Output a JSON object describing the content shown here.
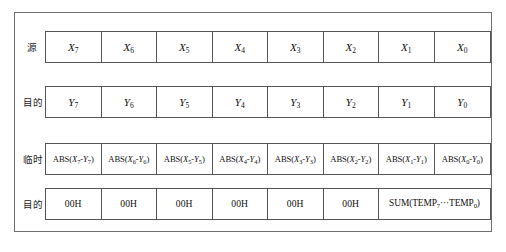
{
  "diagram": {
    "border_color": "#6e6e6e",
    "cell_border_color": "#555555",
    "background": "#ffffff",
    "rows": [
      {
        "id": "source-row",
        "label": "源",
        "label_meaning": "source",
        "cells": [
          {
            "kind": "var",
            "base": "X",
            "sub": "7",
            "text": "X7"
          },
          {
            "kind": "var",
            "base": "X",
            "sub": "6",
            "text": "X6"
          },
          {
            "kind": "var",
            "base": "X",
            "sub": "5",
            "text": "X5"
          },
          {
            "kind": "var",
            "base": "X",
            "sub": "4",
            "text": "X4"
          },
          {
            "kind": "var",
            "base": "X",
            "sub": "3",
            "text": "X3"
          },
          {
            "kind": "var",
            "base": "X",
            "sub": "2",
            "text": "X2"
          },
          {
            "kind": "var",
            "base": "X",
            "sub": "1",
            "text": "X1"
          },
          {
            "kind": "var",
            "base": "X",
            "sub": "0",
            "text": "X0"
          }
        ]
      },
      {
        "id": "destination-row-top",
        "label": "目的",
        "label_meaning": "destination",
        "cells": [
          {
            "kind": "var",
            "base": "Y",
            "sub": "7",
            "text": "Y7"
          },
          {
            "kind": "var",
            "base": "Y",
            "sub": "6",
            "text": "Y6"
          },
          {
            "kind": "var",
            "base": "Y",
            "sub": "5",
            "text": "Y5"
          },
          {
            "kind": "var",
            "base": "Y",
            "sub": "4",
            "text": "Y4"
          },
          {
            "kind": "var",
            "base": "Y",
            "sub": "3",
            "text": "Y3"
          },
          {
            "kind": "var",
            "base": "Y",
            "sub": "2",
            "text": "Y2"
          },
          {
            "kind": "var",
            "base": "Y",
            "sub": "1",
            "text": "Y1"
          },
          {
            "kind": "var",
            "base": "Y",
            "sub": "0",
            "text": "Y0"
          }
        ]
      },
      {
        "id": "temporary-row",
        "label": "临时",
        "label_meaning": "temporary",
        "cells": [
          {
            "kind": "expr",
            "sub": "7",
            "text": "ABS(X7-Y7)"
          },
          {
            "kind": "expr",
            "sub": "6",
            "text": "ABS(X6-Y6)"
          },
          {
            "kind": "expr",
            "sub": "5",
            "text": "ABS(X5-Y5)"
          },
          {
            "kind": "expr",
            "sub": "4",
            "text": "ABS(X4-Y4)"
          },
          {
            "kind": "expr",
            "sub": "3",
            "text": "ABS(X3-Y3)"
          },
          {
            "kind": "expr",
            "sub": "2",
            "text": "ABS(X2-Y2)"
          },
          {
            "kind": "expr",
            "sub": "1",
            "text": "ABS(X1-Y1)"
          },
          {
            "kind": "expr",
            "sub": "0",
            "text": "ABS(X0-Y0)"
          }
        ]
      },
      {
        "id": "destination-row-bottom",
        "label": "目的",
        "label_meaning": "destination",
        "cells": [
          {
            "kind": "hex",
            "text": "00H",
            "span": 1
          },
          {
            "kind": "hex",
            "text": "00H",
            "span": 1
          },
          {
            "kind": "hex",
            "text": "00H",
            "span": 1
          },
          {
            "kind": "hex",
            "text": "00H",
            "span": 1
          },
          {
            "kind": "hex",
            "text": "00H",
            "span": 1
          },
          {
            "kind": "hex",
            "text": "00H",
            "span": 1
          },
          {
            "kind": "sum",
            "text": "SUM(TEMP7···TEMP0)",
            "span": 2
          }
        ]
      }
    ]
  }
}
